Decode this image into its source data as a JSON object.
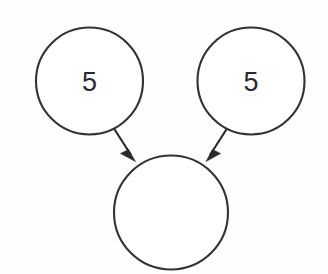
{
  "diagram": {
    "background_color": "#fefefe",
    "stroke_color": "#333333",
    "text_color": "#2b2b2b",
    "nodes": [
      {
        "id": "left-operand",
        "label": "5",
        "cx": 89.5,
        "cy": 81,
        "r": 53.5
      },
      {
        "id": "right-operand",
        "label": "5",
        "cx": 251,
        "cy": 81,
        "r": 53.5
      },
      {
        "id": "result",
        "label": "",
        "cx": 171,
        "cy": 212.5,
        "r": 57
      }
    ],
    "edges": [
      {
        "id": "left-to-result",
        "from": "left-operand",
        "to": "result",
        "label": "",
        "x1": 113,
        "y1": 127,
        "x2": 135.5,
        "y2": 161.5
      },
      {
        "id": "right-to-result",
        "from": "right-operand",
        "to": "result",
        "label": "",
        "x1": 228,
        "y1": 127,
        "x2": 206,
        "y2": 161.5
      }
    ]
  }
}
